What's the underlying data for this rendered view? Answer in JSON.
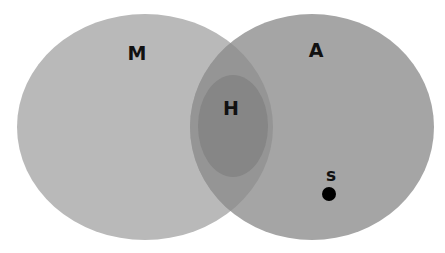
{
  "diagram": {
    "type": "venn",
    "sets": [
      {
        "id": "M",
        "label": "M",
        "fill": "#b9b9b9",
        "cx": 145,
        "cy": 127,
        "rx": 128,
        "ry": 113
      },
      {
        "id": "A",
        "label": "A",
        "fill": "#a5a5a5",
        "cx": 312,
        "cy": 127,
        "rx": 122,
        "ry": 113
      }
    ],
    "subset": {
      "id": "H",
      "label": "H",
      "fill": "#868686",
      "cx": 233,
      "cy": 126,
      "rx": 35,
      "ry": 51,
      "within": [
        "M",
        "A"
      ]
    },
    "intersection_fill": "#959595",
    "point": {
      "id": "s",
      "label": "s",
      "x": 329,
      "y": 194,
      "r": 7,
      "fill": "#000000",
      "within": "A"
    },
    "label_positions": {
      "M": {
        "x": 137,
        "y": 60
      },
      "A": {
        "x": 316,
        "y": 57
      },
      "H": {
        "x": 231,
        "y": 115
      },
      "s": {
        "x": 331,
        "y": 181
      }
    }
  }
}
